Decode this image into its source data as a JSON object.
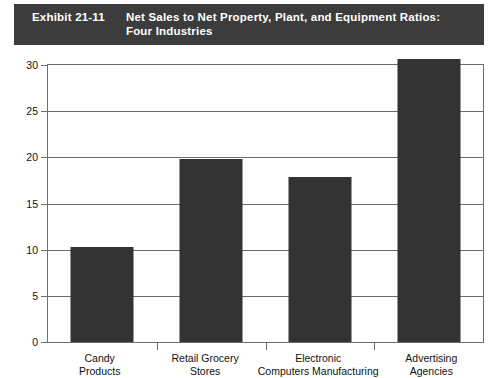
{
  "banner": {
    "exhibit_number": "Exhibit 21-11",
    "title_line1": "Net Sales to Net Property, Plant, and Equipment Ratios:",
    "title_line2": "Four Industries",
    "background_color": "#3c3c3c",
    "text_color": "#ffffff"
  },
  "chart_data": {
    "type": "bar",
    "title": "Net Sales to Net Property, Plant, and Equipment Ratios: Four Industries",
    "xlabel": "",
    "ylabel": "",
    "ylim": [
      0,
      30
    ],
    "yticks": [
      0,
      5,
      10,
      15,
      20,
      25,
      30
    ],
    "ytick_labels": [
      "0",
      "5",
      "10",
      "15",
      "20",
      "25",
      "30"
    ],
    "grid": true,
    "legend": false,
    "bar_color": "#333333",
    "categories": [
      "Candy Products",
      "Retail Grocery Stores",
      "Electronic Computers Manufacturing",
      "Advertising Agencies"
    ],
    "category_lines": [
      [
        "Candy",
        "Products"
      ],
      [
        "Retail Grocery",
        "Stores"
      ],
      [
        "Electronic",
        "Computers Manufacturing"
      ],
      [
        "Advertising",
        "Agencies"
      ]
    ],
    "values": [
      10.3,
      19.8,
      17.9,
      30.6
    ]
  }
}
